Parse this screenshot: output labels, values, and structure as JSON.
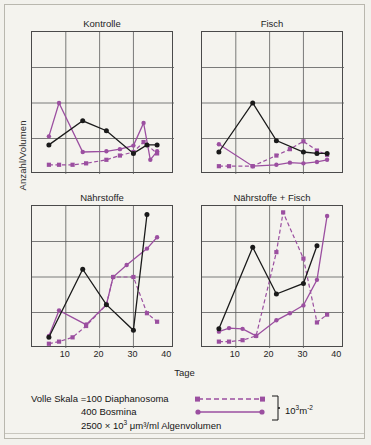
{
  "figure": {
    "ylabel": "Anzahl/Volumen",
    "xlabel": "Tage",
    "colors": {
      "algae_black": "#1a1a1a",
      "purple": "#9b4fa0",
      "grid": "#5a5a5a",
      "frame": "#4a4a4a",
      "background": "#f4f3ee"
    }
  },
  "legend": {
    "prefix": "Volle Skala =",
    "rows": [
      {
        "value": "100",
        "name": "Diaphanosoma",
        "symbol": "dashed-purple-line-with-squares"
      },
      {
        "value": "400",
        "name": "Bosmina",
        "symbol": "solid-purple-line-with-dots"
      },
      {
        "value": "2500 × 10",
        "exp": "3",
        "name": " μm³/ml  Algenvolumen",
        "symbol": "none"
      }
    ],
    "bracket_label_base": "10",
    "bracket_label_exp": "3",
    "bracket_label_unit": "m",
    "bracket_label_unit_exp": "-2"
  },
  "chart_data": {
    "type": "line",
    "title": "",
    "xlabel": "Tage",
    "ylabel": "Anzahl/Volumen",
    "xlim": [
      0,
      42
    ],
    "ylim": [
      0,
      1.0
    ],
    "xticks": [
      10,
      20,
      30,
      40
    ],
    "grid": true,
    "grid_rows": 4,
    "grid_cols": 4,
    "legend_position": "below",
    "series_definitions": [
      {
        "name": "Algenvolumen",
        "style": "solid",
        "color": "#1a1a1a",
        "marker": "circle",
        "full_scale": "2500 × 10^3 µm^3/ml"
      },
      {
        "name": "Diaphanosoma",
        "style": "dashed",
        "color": "#9b4fa0",
        "marker": "square",
        "full_scale": "100 × 10^3 m^-2"
      },
      {
        "name": "Bosmina",
        "style": "solid",
        "color": "#9b4fa0",
        "marker": "circle",
        "full_scale": "400 × 10^3 m^-2"
      }
    ],
    "panels": [
      {
        "label": "Kontrolle",
        "series": [
          {
            "name": "Algenvolumen",
            "x": [
              5,
              15,
              22,
              30,
              34,
              37
            ],
            "y": [
              0.205,
              0.375,
              0.305,
              0.145,
              0.205,
              0.205
            ]
          },
          {
            "name": "Diaphanosoma",
            "x": [
              5,
              8,
              12,
              16,
              22,
              26,
              30,
              33,
              37
            ],
            "y": [
              0.065,
              0.065,
              0.065,
              0.075,
              0.1,
              0.13,
              0.155,
              0.225,
              0.145
            ]
          },
          {
            "name": "Bosmina",
            "x": [
              5,
              8,
              15,
              22,
              26,
              30,
              33,
              35,
              37
            ],
            "y": [
              0.265,
              0.5,
              0.155,
              0.16,
              0.175,
              0.2,
              0.36,
              0.1,
              0.16
            ]
          }
        ]
      },
      {
        "label": "Fisch",
        "series": [
          {
            "name": "Algenvolumen",
            "x": [
              5,
              15,
              22,
              30,
              34,
              37
            ],
            "y": [
              0.155,
              0.5,
              0.235,
              0.155,
              0.145,
              0.145
            ]
          },
          {
            "name": "Diaphanosoma",
            "x": [
              5,
              8,
              15,
              22,
              26,
              30,
              34,
              37
            ],
            "y": [
              0.055,
              0.055,
              0.055,
              0.13,
              0.175,
              0.23,
              0.165,
              0.135
            ]
          },
          {
            "name": "Bosmina",
            "x": [
              5,
              15,
              22,
              26,
              30,
              34,
              37
            ],
            "y": [
              0.21,
              0.055,
              0.065,
              0.08,
              0.075,
              0.085,
              0.1
            ]
          }
        ]
      },
      {
        "label": "Nährstoffe",
        "series": [
          {
            "name": "Algenvolumen",
            "x": [
              5,
              15,
              22,
              30,
              34
            ],
            "y": [
              0.075,
              0.555,
              0.305,
              0.125,
              0.94
            ]
          },
          {
            "name": "Diaphanosoma",
            "x": [
              5,
              8,
              12,
              16,
              22,
              24,
              30,
              34,
              37
            ],
            "y": [
              0.03,
              0.045,
              0.075,
              0.155,
              0.305,
              0.5,
              0.5,
              0.245,
              0.185
            ]
          },
          {
            "name": "Bosmina",
            "x": [
              5,
              8,
              16,
              22,
              24,
              28,
              34,
              37
            ],
            "y": [
              0.085,
              0.265,
              0.165,
              0.305,
              0.5,
              0.585,
              0.7,
              0.78
            ]
          }
        ]
      },
      {
        "label": "Nährstoffe + Fisch",
        "series": [
          {
            "name": "Algenvolumen",
            "x": [
              5,
              15,
              22,
              30,
              34
            ],
            "y": [
              0.135,
              0.71,
              0.38,
              0.455,
              0.72
            ]
          },
          {
            "name": "Diaphanosoma",
            "x": [
              5,
              8,
              12,
              16,
              22,
              24,
              30,
              34,
              37
            ],
            "y": [
              0.045,
              0.045,
              0.055,
              0.085,
              0.675,
              0.955,
              0.63,
              0.18,
              0.235
            ]
          },
          {
            "name": "Bosmina",
            "x": [
              5,
              8,
              12,
              16,
              22,
              26,
              30,
              34,
              37
            ],
            "y": [
              0.115,
              0.14,
              0.135,
              0.085,
              0.195,
              0.245,
              0.3,
              0.48,
              0.93
            ]
          }
        ]
      }
    ]
  }
}
